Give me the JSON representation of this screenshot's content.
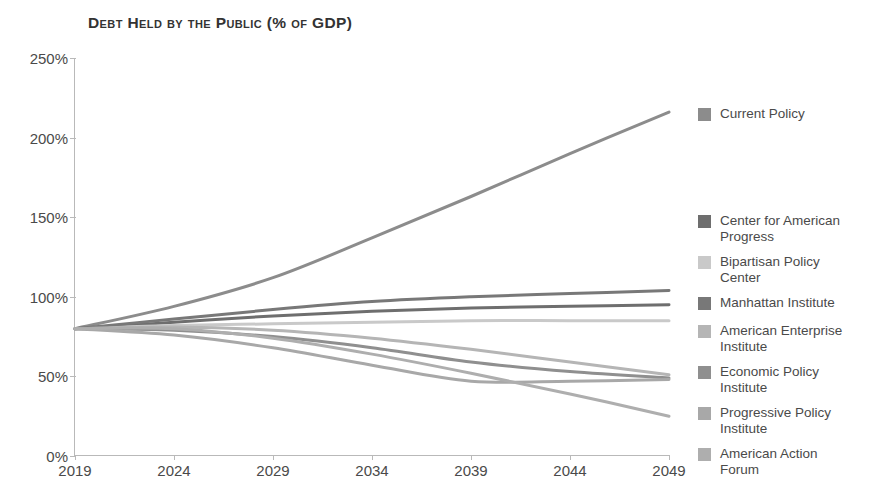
{
  "chart_data": {
    "type": "line",
    "title": "Debt Held by the Public (% of GDP)",
    "xlabel": "",
    "ylabel": "",
    "xlim": [
      2019,
      2049
    ],
    "ylim": [
      0,
      250
    ],
    "ytick_labels": [
      "0%",
      "50%",
      "100%",
      "150%",
      "200%",
      "250%"
    ],
    "ytick_values": [
      0,
      50,
      100,
      150,
      200,
      250
    ],
    "xtick_labels": [
      "2019",
      "2024",
      "2029",
      "2034",
      "2039",
      "2044",
      "2049"
    ],
    "xtick_values": [
      2019,
      2024,
      2029,
      2034,
      2039,
      2044,
      2049
    ],
    "grid": false,
    "legend_position": "right",
    "x": [
      2019,
      2024,
      2029,
      2034,
      2039,
      2044,
      2049
    ],
    "series": [
      {
        "name": "Current Policy",
        "color": "#8c8c8c",
        "values": [
          80,
          94,
          112,
          137,
          163,
          190,
          216
        ]
      },
      {
        "name": "Center for American\nProgress",
        "color": "#6e6e6e",
        "values": [
          80,
          84,
          88,
          91,
          93,
          94,
          95
        ]
      },
      {
        "name": "Bipartisan Policy\nCenter",
        "color": "#c9c9c9",
        "values": [
          80,
          82,
          83,
          84,
          85,
          85,
          85
        ]
      },
      {
        "name": "Manhattan Institute",
        "color": "#787878",
        "values": [
          80,
          86,
          92,
          97,
          100,
          102,
          104
        ]
      },
      {
        "name": "American Enterprise\nInstitute",
        "color": "#b5b5b5",
        "values": [
          80,
          81,
          79,
          74,
          67,
          59,
          51
        ]
      },
      {
        "name": "Economic Policy\nInstitute",
        "color": "#8f8f8f",
        "values": [
          80,
          79,
          75,
          68,
          59,
          53,
          49
        ]
      },
      {
        "name": "Progressive Policy\nInstitute",
        "color": "#a8a8a8",
        "values": [
          80,
          76,
          68,
          57,
          47,
          47,
          48
        ]
      },
      {
        "name": "American Action\nForum",
        "color": "#aeaeae",
        "values": [
          80,
          80,
          74,
          64,
          52,
          39,
          25
        ]
      }
    ],
    "legend_entry_tops": [
      48,
      155,
      196,
      237,
      265,
      306,
      347,
      388
    ]
  }
}
